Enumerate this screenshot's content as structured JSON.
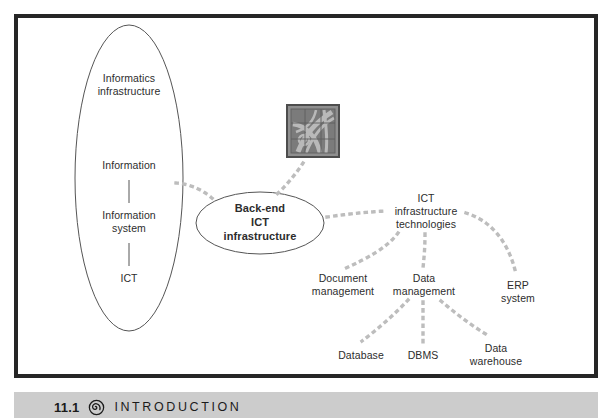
{
  "figure": {
    "type": "concept-map",
    "background": "#ffffff",
    "frame_color": "#262626",
    "connector_color": "#b8b8b8",
    "outline_color": "#555555",
    "text_color": "#2d2d2d"
  },
  "left_ellipse": {
    "name": "informatics-infrastructure-ellipse",
    "levels": [
      {
        "id": "informatics-infrastructure",
        "label": "Informatics\ninfrastructure"
      },
      {
        "id": "information",
        "label": "Information"
      },
      {
        "id": "information-system",
        "label": "Information\nsystem"
      },
      {
        "id": "ict",
        "label": "ICT"
      }
    ]
  },
  "center_ellipse": {
    "name": "back-end-ict-infrastructure-ellipse",
    "label": "Back-end\nICT\ninfrastructure"
  },
  "tile_icon": {
    "name": "chapter-tile-icon",
    "icon": "decorative-tile-icon"
  },
  "tree": {
    "root": {
      "id": "ict-infrastructure-technologies",
      "label": "ICT\ninfrastructure\ntechnologies"
    },
    "children": [
      {
        "id": "document-management",
        "label": "Document\nmanagement"
      },
      {
        "id": "data-management",
        "label": "Data\nmanagement"
      },
      {
        "id": "erp-system",
        "label": "ERP\nsystem"
      }
    ],
    "grandchildren": [
      {
        "id": "database",
        "label": "Database",
        "parent": "data-management"
      },
      {
        "id": "dbms",
        "label": "DBMS",
        "parent": "data-management"
      },
      {
        "id": "data-warehouse",
        "label": "Data\nwarehouse",
        "parent": "data-management"
      }
    ]
  },
  "caption": {
    "number": "11.1",
    "title": "INTRODUCTION",
    "icon": "spiral-icon",
    "bar_color": "#cccccc"
  }
}
